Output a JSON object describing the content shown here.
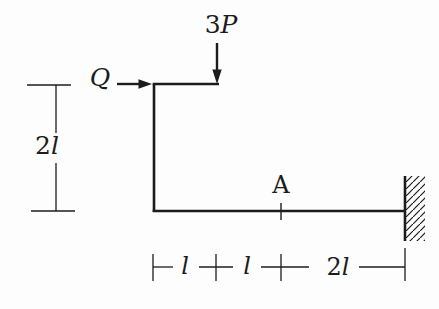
{
  "diagram": {
    "type": "structural-frame-free-body-diagram",
    "background_color": "#fdfdfd",
    "line_color": "#1c1c1c",
    "force_down": {
      "coefficient": "3",
      "symbol": "P"
    },
    "force_right": {
      "coefficient": "",
      "symbol": "Q"
    },
    "point_label": "A",
    "dim_left": {
      "coefficient": "2",
      "symbol": "l"
    },
    "dim_bottom": [
      {
        "coefficient": "",
        "symbol": "l"
      },
      {
        "coefficient": "",
        "symbol": "l"
      },
      {
        "coefficient": "2",
        "symbol": "l"
      }
    ]
  }
}
